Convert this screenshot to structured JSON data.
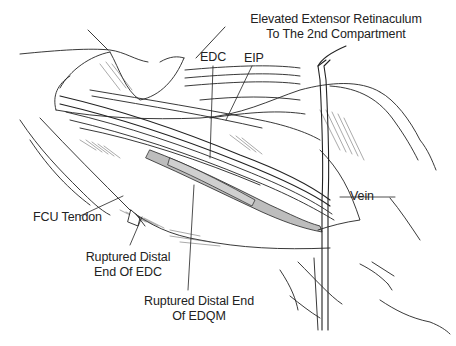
{
  "figure": {
    "type": "surgical line illustration",
    "colors": {
      "ink": "#222222",
      "tendon_fill": "#bdbdbd",
      "background": "#ffffff"
    }
  },
  "labels": {
    "retinaculum": {
      "line1": "Elevated Extensor Retinaculum",
      "line2": "To The 2nd Compartment"
    },
    "edc": "EDC",
    "eip": "EIP",
    "vein": "Vein",
    "fcu": "FCU Tendon",
    "ruptured_edc": {
      "line1": "Ruptured Distal",
      "line2": "End Of EDC"
    },
    "ruptured_edqm": {
      "line1": "Ruptured Distal End",
      "line2": "Of EDQM"
    }
  }
}
